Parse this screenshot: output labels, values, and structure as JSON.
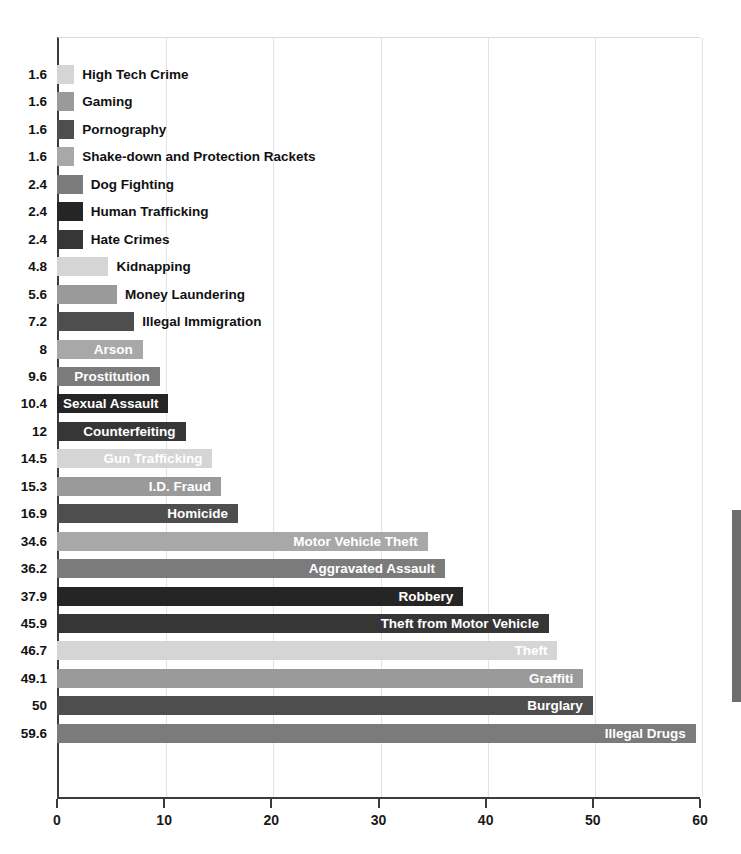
{
  "chart_data": {
    "type": "bar",
    "orientation": "horizontal",
    "title": "",
    "subtitle": "",
    "xlabel": "",
    "ylabel": "",
    "xlim": [
      0,
      60
    ],
    "xticks": [
      0,
      10,
      20,
      30,
      40,
      50,
      60
    ],
    "xtick_labels": [
      "0",
      "10",
      "20",
      "30",
      "40",
      "50",
      "60"
    ],
    "grid": "vertical",
    "legend": "none",
    "categories": [
      "High Tech Crime",
      "Gaming",
      "Pornography",
      "Shake-down and Protection Rackets",
      "Dog Fighting",
      "Human Trafficking",
      "Hate Crimes",
      "Kidnapping",
      "Money  Laundering",
      "Illegal Immigration",
      "Arson",
      "Prostitution",
      "Sexual Assault",
      "Counterfeiting",
      "Gun Trafficking",
      "I.D. Fraud",
      "Homicide",
      "Motor Vehicle Theft",
      "Aggravated Assault",
      "Robbery",
      "Theft from Motor Vehicle",
      "Theft",
      "Graffiti",
      "Burglary",
      "Illegal Drugs"
    ],
    "values": [
      1.6,
      1.6,
      1.6,
      1.6,
      2.4,
      2.4,
      2.4,
      4.8,
      5.6,
      7.2,
      8,
      9.6,
      10.4,
      12,
      14.5,
      15.3,
      16.9,
      34.6,
      36.2,
      37.9,
      45.9,
      46.7,
      49.1,
      50,
      59.6
    ],
    "value_labels": [
      "1.6",
      "1.6",
      "1.6",
      "1.6",
      "2.4",
      "2.4",
      "2.4",
      "4.8",
      "5.6",
      "7.2",
      "8",
      "9.6",
      "10.4",
      "12",
      "14.5",
      "15.3",
      "16.9",
      "34.6",
      "36.2",
      "37.9",
      "45.9",
      "46.7",
      "49.1",
      "50",
      "59.6"
    ],
    "bar_colors": [
      "#d5d5d5",
      "#9a9a9a",
      "#4e4e4e",
      "#a8a8a8",
      "#7b7b7b",
      "#252525",
      "#363636",
      "#d5d5d5",
      "#9a9a9a",
      "#4e4e4e",
      "#a8a8a8",
      "#7b7b7b",
      "#252525",
      "#363636",
      "#d5d5d5",
      "#9a9a9a",
      "#4e4e4e",
      "#a8a8a8",
      "#7b7b7b",
      "#252525",
      "#363636",
      "#d5d5d5",
      "#9a9a9a",
      "#4e4e4e",
      "#7b7b7b"
    ],
    "label_placement": [
      "outside",
      "outside",
      "outside",
      "outside",
      "outside",
      "outside",
      "outside",
      "outside",
      "outside",
      "outside",
      "inside",
      "inside",
      "inside",
      "inside",
      "inside",
      "inside",
      "inside",
      "inside",
      "inside",
      "inside",
      "inside",
      "inside",
      "inside",
      "inside",
      "inside"
    ]
  },
  "axis": {
    "x_axis_name": "x-axis",
    "y_axis_name": "y-axis"
  },
  "artifacts": {
    "edge_strip_color": "#6e6e6e"
  }
}
